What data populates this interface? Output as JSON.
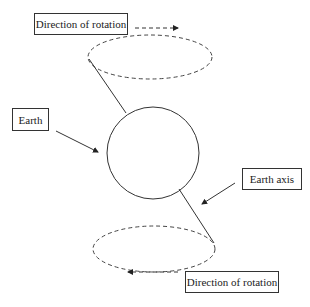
{
  "labels": {
    "top_rotation": "Direction of rotation",
    "earth": "Earth",
    "earth_axis": "Earth axis",
    "bottom_rotation": "Direction of rotation"
  },
  "colors": {
    "stroke": "#333333",
    "background": "#ffffff"
  }
}
